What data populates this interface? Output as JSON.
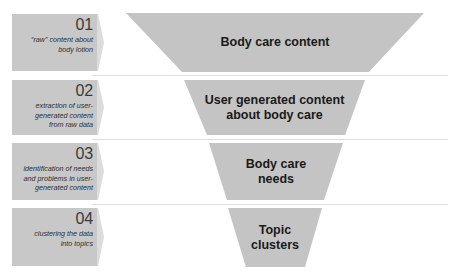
{
  "steps": [
    {
      "number": "01",
      "description": "“raw” content about body lotion",
      "stage_label": "Body care content"
    },
    {
      "number": "02",
      "description": "extraction of user-generated content from raw data",
      "stage_label": "User generated content about body care"
    },
    {
      "number": "03",
      "description": "identification of needs and problems in user-generated content",
      "stage_label": "Body care needs"
    },
    {
      "number": "04",
      "description": "clustering the data into topics",
      "stage_label": "Topic clusters"
    }
  ],
  "display": {
    "step1_desc_lines": [
      "“raw” content about",
      "body lotion"
    ],
    "step2_desc_lines": [
      "extraction of user-",
      "generated content",
      "from raw data"
    ],
    "step3_desc_lines": [
      "identification of needs",
      "and problems in user-",
      "generated content"
    ],
    "step4_desc_lines": [
      "clustering the data",
      "into topics"
    ],
    "stage1_lines": [
      "Body care content"
    ],
    "stage2_lines": [
      "User generated content",
      "about body care"
    ],
    "stage3_lines": [
      "Body care",
      "needs"
    ],
    "stage4_lines": [
      "Topic",
      "clusters"
    ]
  },
  "colors": {
    "box_fill": "#c8c8c8",
    "funnel_fill": "#c4c4c4",
    "separator": "#dddddd",
    "text": "#1a1a1a"
  }
}
